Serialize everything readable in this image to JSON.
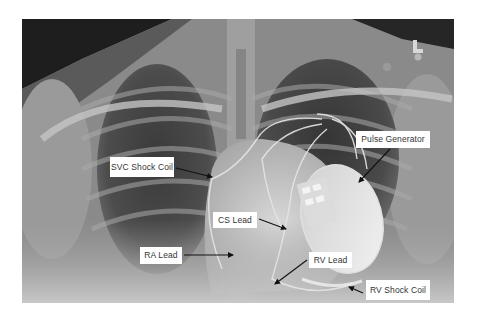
{
  "image": {
    "subject": "Chest X-ray with implanted cardiac device (CRT-D)",
    "orientation_marker": "L",
    "marker_text": "LTH"
  },
  "labels": [
    {
      "id": "svc-shock-coil",
      "text": "SVC Shock Coil"
    },
    {
      "id": "pulse-generator",
      "text": "Pulse Generator"
    },
    {
      "id": "cs-lead",
      "text": "CS Lead"
    },
    {
      "id": "ra-lead",
      "text": "RA Lead"
    },
    {
      "id": "rv-lead",
      "text": "RV Lead"
    },
    {
      "id": "rv-shock-coil",
      "text": "RV Shock Coil"
    }
  ],
  "colors": {
    "label_bg": "#ffffff",
    "label_text": "#333333",
    "arrow": "#111111",
    "page_bg": "#ffffff"
  }
}
